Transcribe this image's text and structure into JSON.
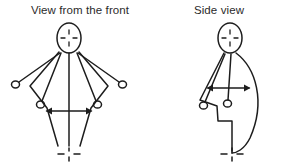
{
  "diagram": {
    "background_color": "#ffffff",
    "stroke_color": "#1d1d1d",
    "text_color": "#2b2b2b",
    "panels": [
      {
        "id": "front",
        "title": "View from the front",
        "figure": {
          "head_marker": "crosshair",
          "arm_positions": [
            "outer-extended",
            "inner-lowered"
          ],
          "hand_markers": 4,
          "motion_arrow": "double-headed-horizontal",
          "base_marker": "crosshair"
        }
      },
      {
        "id": "side",
        "title": "Side view",
        "figure": {
          "head_marker": "crosshair",
          "arm_positions": [
            "outer-extended",
            "inner-lowered"
          ],
          "hand_markers": 2,
          "motion_arrow": "double-headed-horizontal",
          "base_marker": "crosshair"
        }
      }
    ]
  }
}
